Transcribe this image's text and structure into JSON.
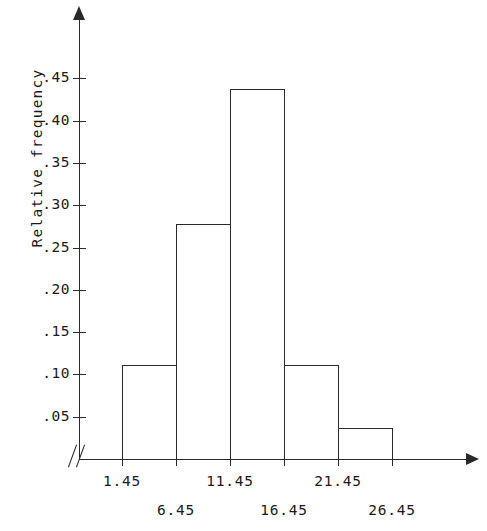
{
  "figure": {
    "background_color": "#ffffff",
    "line_color": "#2a2a2a"
  },
  "axes": {
    "y_title": "Relative frequency",
    "x_title": "",
    "break_marker": "//",
    "y_ticks": [
      ".05",
      ".10",
      ".15",
      ".20",
      ".25",
      ".30",
      ".35",
      ".40",
      ".45"
    ],
    "x_ticks": [
      "1.45",
      "6.45",
      "11.45",
      "16.45",
      "21.45",
      "26.45"
    ]
  },
  "chart_data": {
    "type": "bar",
    "title": "",
    "xlabel": "",
    "ylabel": "Relative frequency",
    "categories": [
      "1.45-6.45",
      "6.45-11.45",
      "11.45-16.45",
      "16.45-21.45",
      "21.45-26.45"
    ],
    "bin_edges": [
      1.45,
      6.45,
      11.45,
      16.45,
      21.45,
      26.45
    ],
    "values": [
      0.111,
      0.278,
      0.438,
      0.111,
      0.037
    ],
    "ylim": [
      0,
      0.47
    ],
    "xlim": [
      1.45,
      26.45
    ],
    "ytick_values": [
      0.05,
      0.1,
      0.15,
      0.2,
      0.25,
      0.3,
      0.35,
      0.4,
      0.45
    ],
    "ytick_labels": [
      ".05",
      ".10",
      ".15",
      ".20",
      ".25",
      ".30",
      ".35",
      ".40",
      ".45"
    ],
    "xtick_values": [
      1.45,
      6.45,
      11.45,
      16.45,
      21.45,
      26.45
    ],
    "xtick_labels": [
      "1.45",
      "6.45",
      "11.45",
      "16.45",
      "21.45",
      "26.45"
    ],
    "grid": false,
    "legend": null,
    "bar_fill": "none",
    "bar_edge_color": "#2a2a2a",
    "x_axis_break": true,
    "annotations": []
  }
}
